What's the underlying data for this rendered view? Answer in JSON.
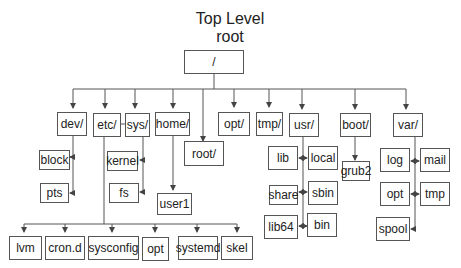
{
  "title": {
    "line1": "Top Level",
    "line2": "root"
  },
  "root": {
    "label": "/"
  },
  "level1": {
    "dev": "dev/",
    "etc": "etc/",
    "sys": "sys/",
    "home": "home/",
    "root": "root/",
    "opt": "opt/",
    "tmp": "tmp/",
    "usr": "usr/",
    "boot": "boot/",
    "var": "var/"
  },
  "dev_children": [
    "block",
    "pts"
  ],
  "sys_children": [
    "kernel",
    "fs"
  ],
  "home_children": [
    "user1"
  ],
  "boot_children": [
    "grub2"
  ],
  "usr_children": {
    "left": [
      "lib",
      "share",
      "lib64"
    ],
    "right": [
      "local",
      "sbin",
      "bin"
    ]
  },
  "var_children": {
    "left": [
      "log",
      "opt",
      "spool"
    ],
    "right": [
      "mail",
      "tmp"
    ]
  },
  "etc_children": [
    "lvm",
    "cron.d",
    "sysconfig",
    "opt",
    "systemd",
    "skel"
  ],
  "colors": {
    "line": "#555555",
    "text": "#222222",
    "background": "#ffffff"
  }
}
